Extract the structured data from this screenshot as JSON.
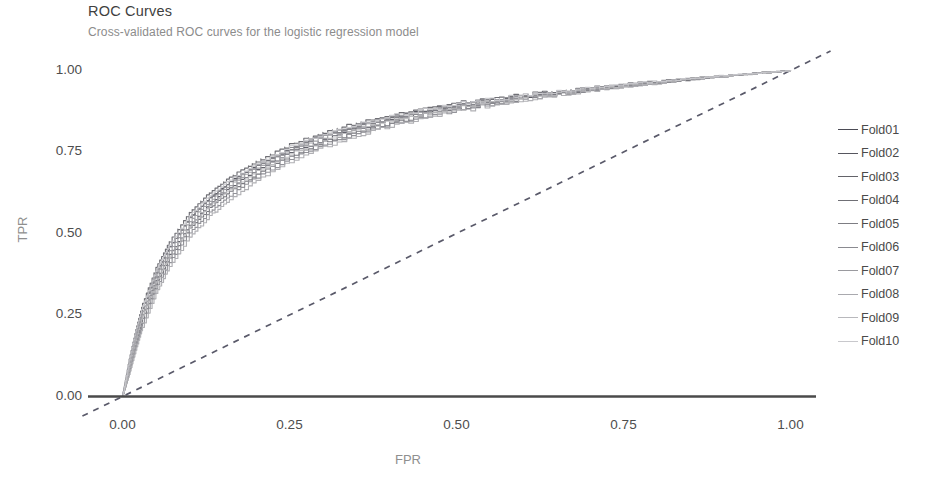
{
  "chart_data": {
    "type": "line",
    "title": "ROC Curves",
    "subtitle": "Cross-validated ROC curves for the logistic regression model",
    "xlabel": "FPR",
    "ylabel": "TPR",
    "xlim": [
      0,
      1
    ],
    "ylim": [
      0,
      1
    ],
    "grid": false,
    "legend_position": "right",
    "xticks": [
      "0.00",
      "0.25",
      "0.50",
      "0.75",
      "1.00"
    ],
    "xtick_values": [
      0,
      0.25,
      0.5,
      0.75,
      1
    ],
    "yticks": [
      "0.00",
      "0.25",
      "0.50",
      "0.75",
      "1.00"
    ],
    "ytick_values": [
      0,
      0.25,
      0.5,
      0.75,
      1
    ],
    "reference_line": {
      "name": "chance-diagonal",
      "style": "dashed",
      "color": "#5a5a6a",
      "from": [
        0,
        0
      ],
      "to": [
        1,
        1
      ]
    },
    "x": [
      0,
      0.01,
      0.02,
      0.03,
      0.05,
      0.07,
      0.1,
      0.13,
      0.16,
      0.2,
      0.25,
      0.3,
      0.35,
      0.4,
      0.45,
      0.5,
      0.55,
      0.6,
      0.65,
      0.7,
      0.75,
      0.8,
      0.85,
      0.9,
      0.95,
      1
    ],
    "series": [
      {
        "name": "Fold01",
        "color": "#4b4b55",
        "values": [
          0,
          0.1,
          0.19,
          0.27,
          0.38,
          0.46,
          0.55,
          0.61,
          0.66,
          0.71,
          0.76,
          0.8,
          0.83,
          0.855,
          0.875,
          0.893,
          0.908,
          0.921,
          0.933,
          0.944,
          0.954,
          0.964,
          0.973,
          0.982,
          0.991,
          1
        ]
      },
      {
        "name": "Fold02",
        "color": "#56565f",
        "values": [
          0,
          0.09,
          0.175,
          0.25,
          0.355,
          0.435,
          0.525,
          0.59,
          0.64,
          0.695,
          0.748,
          0.788,
          0.82,
          0.846,
          0.868,
          0.887,
          0.903,
          0.918,
          0.931,
          0.943,
          0.954,
          0.965,
          0.975,
          0.984,
          0.992,
          1
        ]
      },
      {
        "name": "Fold03",
        "color": "#636369",
        "values": [
          0,
          0.115,
          0.205,
          0.285,
          0.395,
          0.475,
          0.565,
          0.625,
          0.672,
          0.722,
          0.772,
          0.81,
          0.839,
          0.862,
          0.881,
          0.898,
          0.912,
          0.925,
          0.937,
          0.947,
          0.957,
          0.967,
          0.976,
          0.984,
          0.992,
          1
        ]
      },
      {
        "name": "Fold04",
        "color": "#6f6f75",
        "values": [
          0,
          0.085,
          0.165,
          0.24,
          0.345,
          0.425,
          0.515,
          0.578,
          0.628,
          0.683,
          0.738,
          0.78,
          0.812,
          0.84,
          0.863,
          0.883,
          0.9,
          0.915,
          0.929,
          0.941,
          0.952,
          0.963,
          0.974,
          0.983,
          0.992,
          1
        ]
      },
      {
        "name": "Fold05",
        "color": "#7d7d83",
        "values": [
          0,
          0.105,
          0.195,
          0.272,
          0.378,
          0.458,
          0.548,
          0.608,
          0.657,
          0.709,
          0.761,
          0.801,
          0.831,
          0.856,
          0.876,
          0.894,
          0.909,
          0.923,
          0.935,
          0.946,
          0.956,
          0.966,
          0.975,
          0.984,
          0.992,
          1
        ]
      },
      {
        "name": "Fold06",
        "color": "#8a8a90",
        "values": [
          0,
          0.075,
          0.152,
          0.225,
          0.33,
          0.412,
          0.502,
          0.566,
          0.617,
          0.673,
          0.729,
          0.772,
          0.806,
          0.834,
          0.858,
          0.879,
          0.897,
          0.913,
          0.927,
          0.94,
          0.951,
          0.962,
          0.973,
          0.983,
          0.991,
          1
        ]
      },
      {
        "name": "Fold07",
        "color": "#9a9a9f",
        "values": [
          0,
          0.098,
          0.185,
          0.262,
          0.368,
          0.448,
          0.538,
          0.6,
          0.649,
          0.702,
          0.755,
          0.795,
          0.826,
          0.852,
          0.873,
          0.891,
          0.907,
          0.921,
          0.934,
          0.945,
          0.955,
          0.966,
          0.975,
          0.984,
          0.992,
          1
        ]
      },
      {
        "name": "Fold08",
        "color": "#a9a9ae",
        "values": [
          0,
          0.068,
          0.142,
          0.212,
          0.315,
          0.398,
          0.488,
          0.553,
          0.605,
          0.662,
          0.72,
          0.764,
          0.799,
          0.828,
          0.853,
          0.875,
          0.893,
          0.91,
          0.925,
          0.938,
          0.95,
          0.961,
          0.972,
          0.982,
          0.991,
          1
        ]
      },
      {
        "name": "Fold09",
        "color": "#b8b8bc",
        "values": [
          0,
          0.09,
          0.172,
          0.248,
          0.352,
          0.432,
          0.522,
          0.585,
          0.635,
          0.69,
          0.744,
          0.785,
          0.817,
          0.844,
          0.866,
          0.885,
          0.902,
          0.917,
          0.93,
          0.942,
          0.953,
          0.964,
          0.974,
          0.983,
          0.992,
          1
        ]
      },
      {
        "name": "Fold10",
        "color": "#c8c8cc",
        "values": [
          0,
          0.112,
          0.2,
          0.278,
          0.385,
          0.465,
          0.555,
          0.616,
          0.664,
          0.715,
          0.766,
          0.805,
          0.835,
          0.859,
          0.879,
          0.896,
          0.911,
          0.924,
          0.936,
          0.947,
          0.957,
          0.967,
          0.976,
          0.985,
          0.992,
          1
        ]
      }
    ]
  }
}
